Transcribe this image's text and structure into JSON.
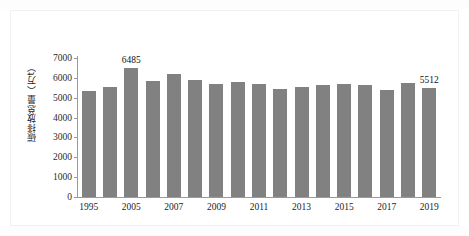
{
  "figure": {
    "background_color": "#ffffff",
    "bar_color": "#818181",
    "axis_color": "#9a9a9a",
    "text_color": "#1d1d1d"
  },
  "axis": {
    "y_title": "碳排放总量（万t）",
    "y_ticks": [
      "0",
      "1000",
      "2000",
      "3000",
      "4000",
      "5000",
      "6000",
      "7000"
    ],
    "x_ticks": [
      "1995",
      "2005",
      "2007",
      "2009",
      "2011",
      "2013",
      "2015",
      "2017",
      "2019"
    ]
  },
  "chart_data": {
    "type": "bar",
    "title": "",
    "xlabel": "",
    "ylabel": "碳排放总量（万t）",
    "ylim": [
      0,
      7000
    ],
    "ytick_step": 1000,
    "grid": false,
    "legend": "none",
    "categories": [
      "1995",
      "2000",
      "2005",
      "2006",
      "2007",
      "2008",
      "2009",
      "2010",
      "2011",
      "2012",
      "2013",
      "2014",
      "2015",
      "2016",
      "2017",
      "2018",
      "2019"
    ],
    "labeled_categories": [
      "1995",
      "2005",
      "2007",
      "2009",
      "2011",
      "2013",
      "2015",
      "2017",
      "2019"
    ],
    "bars": [
      {
        "index": 1,
        "category": "1995",
        "value": 5350,
        "label": "",
        "labeled": false
      },
      {
        "index": 2,
        "category": "2000",
        "value": 5540,
        "label": "",
        "labeled": false
      },
      {
        "index": 3,
        "category": "2005",
        "value": 6485,
        "label": "6485",
        "labeled": true
      },
      {
        "index": 4,
        "category": "2006",
        "value": 5860,
        "label": "",
        "labeled": false
      },
      {
        "index": 5,
        "category": "2007",
        "value": 6180,
        "label": "",
        "labeled": false
      },
      {
        "index": 6,
        "category": "2008",
        "value": 5870,
        "label": "",
        "labeled": false
      },
      {
        "index": 7,
        "category": "2009",
        "value": 5670,
        "label": "",
        "labeled": false
      },
      {
        "index": 8,
        "category": "2010",
        "value": 5810,
        "label": "",
        "labeled": false
      },
      {
        "index": 9,
        "category": "2011",
        "value": 5690,
        "label": "",
        "labeled": false
      },
      {
        "index": 10,
        "category": "2012",
        "value": 5460,
        "label": "",
        "labeled": false
      },
      {
        "index": 11,
        "category": "2013",
        "value": 5550,
        "label": "",
        "labeled": false
      },
      {
        "index": 12,
        "category": "2014",
        "value": 5630,
        "label": "",
        "labeled": false
      },
      {
        "index": 13,
        "category": "2015",
        "value": 5690,
        "label": "",
        "labeled": false
      },
      {
        "index": 14,
        "category": "2016",
        "value": 5620,
        "label": "",
        "labeled": false
      },
      {
        "index": 15,
        "category": "2017",
        "value": 5410,
        "label": "",
        "labeled": false
      },
      {
        "index": 16,
        "category": "2018",
        "value": 5760,
        "label": "",
        "labeled": false
      },
      {
        "index": 17,
        "category": "2019",
        "value": 5512,
        "label": "5512",
        "labeled": true
      }
    ]
  }
}
